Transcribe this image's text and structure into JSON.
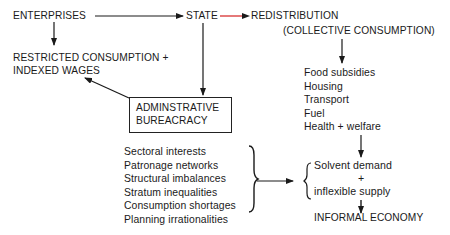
{
  "diagram": {
    "nodes": {
      "enterprises": "ENTERPRISES",
      "state": "STATE",
      "redistribution": "REDISTRIBUTION",
      "collective_consumption": "(COLLECTIVE CONSUMPTION)",
      "restricted_line1": "RESTRICTED CONSUMPTION +",
      "restricted_line2": "INDEXED WAGES",
      "bureaucracy_line1": "ADMINSTRATIVE",
      "bureaucracy_line2": "BUREACRACY",
      "solvent_demand": "Solvent demand",
      "plus": "+",
      "inflexible_supply": "inflexible supply",
      "informal_economy": "INFORMAL ECONOMY"
    },
    "consumption_items": [
      "Food subsidies",
      "Housing",
      "Transport",
      "Fuel",
      "Health + welfare"
    ],
    "bureaucracy_factors": [
      "Sectoral interests",
      "Patronage networks",
      "Structural imbalances",
      "Stratum inequalities",
      "Consumption shortages",
      "Planning irrationalities"
    ],
    "colors": {
      "line": "#1a1a1a",
      "highlight_arrow": "#d42020"
    }
  }
}
